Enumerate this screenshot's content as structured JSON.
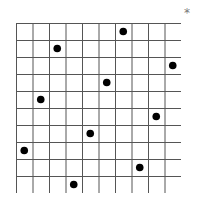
{
  "marker": "*",
  "grid": {
    "rows": 10,
    "cols": 10
  },
  "dots": [
    [
      6,
      0
    ],
    [
      2,
      1
    ],
    [
      9,
      2
    ],
    [
      5,
      3
    ],
    [
      1,
      4
    ],
    [
      8,
      5
    ],
    [
      4,
      6
    ],
    [
      0,
      7
    ],
    [
      7,
      8
    ],
    [
      3,
      9
    ]
  ]
}
